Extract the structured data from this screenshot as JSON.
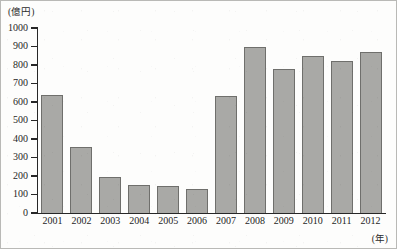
{
  "figure": {
    "unit_caption": "(億円)",
    "xaxis_unit": "(年)"
  },
  "chart_data": {
    "type": "bar",
    "title": "",
    "subtitle": "",
    "xlabel": "(年)",
    "ylabel": "(億円)",
    "categories": [
      "2001",
      "2002",
      "2003",
      "2004",
      "2005",
      "2006",
      "2007",
      "2008",
      "2009",
      "2010",
      "2011",
      "2012"
    ],
    "values": [
      640,
      355,
      195,
      150,
      145,
      130,
      630,
      900,
      780,
      850,
      820,
      870
    ],
    "ylim": [
      0,
      1000
    ],
    "ytick_labels": [
      "1000",
      "900",
      "800",
      "700",
      "600",
      "500",
      "400",
      "300",
      "200",
      "100",
      "0"
    ],
    "ytick_values": [
      1000,
      900,
      800,
      700,
      600,
      500,
      400,
      300,
      200,
      100,
      0
    ],
    "grid": false,
    "legend": null,
    "legend_position": "none",
    "bar_color": "#a9a9a6",
    "bar_edge_color": "#6f6f6c",
    "axis_color": "#272727"
  }
}
